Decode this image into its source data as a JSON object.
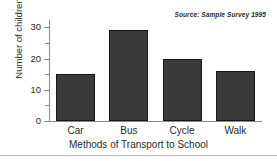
{
  "chart_data": {
    "type": "bar",
    "title": "",
    "categories": [
      "Car",
      "Bus",
      "Cycle",
      "Walk"
    ],
    "values": [
      15,
      29,
      20,
      16
    ],
    "xlabel": "Methods of Transport to School",
    "ylabel": "Number of children",
    "ylim": [
      0,
      32
    ],
    "ytick_labels": [
      "0",
      "10",
      "20",
      "30"
    ],
    "ytick_values": [
      0,
      10,
      20,
      30
    ],
    "minor_tick_interval": 5,
    "grid": false,
    "legend": false,
    "annotation": "Source: Sample Survey 1995",
    "annotation_position": "top-right",
    "bar_color": "#3a3a3a",
    "bar_edge_color": "#171717",
    "axis_color": "#8a8a8a",
    "background_color": "#ffffff"
  }
}
